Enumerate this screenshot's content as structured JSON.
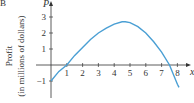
{
  "panel_label": "B",
  "chart_data": {
    "type": "line",
    "title": "",
    "xlabel": "x",
    "ylabel": "P",
    "ylabel_side": "Profit (in millions of dollars)",
    "x_ticks": [
      1,
      2,
      3,
      4,
      5,
      6,
      7,
      8
    ],
    "y_ticks": [
      -1,
      1,
      2,
      3
    ],
    "xlim": [
      0,
      8.4
    ],
    "ylim": [
      -2,
      3.6
    ],
    "grid": false,
    "color": "#4a9fd4",
    "series": [
      {
        "name": "P(x)",
        "x": [
          0,
          0.5,
          1,
          1.5,
          2,
          2.5,
          3,
          3.5,
          4,
          4.5,
          4.7,
          5,
          5.5,
          6,
          6.5,
          7,
          7.5,
          8,
          8.1
        ],
        "y": [
          -1,
          -0.4,
          0,
          0.6,
          1.1,
          1.6,
          2.0,
          2.3,
          2.55,
          2.7,
          2.7,
          2.65,
          2.4,
          2.0,
          1.45,
          0.8,
          0.0,
          -1.2,
          -1.4
        ]
      }
    ]
  },
  "labels": {
    "y_axis_name": "P",
    "x_axis_name": "x",
    "side_line1": "Profit",
    "side_line2": "(in millions of dollars)",
    "xt": [
      "1",
      "2",
      "3",
      "4",
      "5",
      "6",
      "7",
      "8"
    ],
    "yt": [
      "3",
      "2",
      "1",
      "−1"
    ]
  }
}
